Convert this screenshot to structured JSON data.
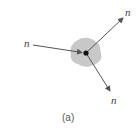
{
  "diagram": {
    "incoming_label": "n",
    "outgoing_labels": [
      "n",
      "n"
    ],
    "caption": "(a)",
    "colors": {
      "nucleus_fill": "#c8c8c8",
      "arrow": "#555555",
      "dot": "#111111"
    }
  }
}
